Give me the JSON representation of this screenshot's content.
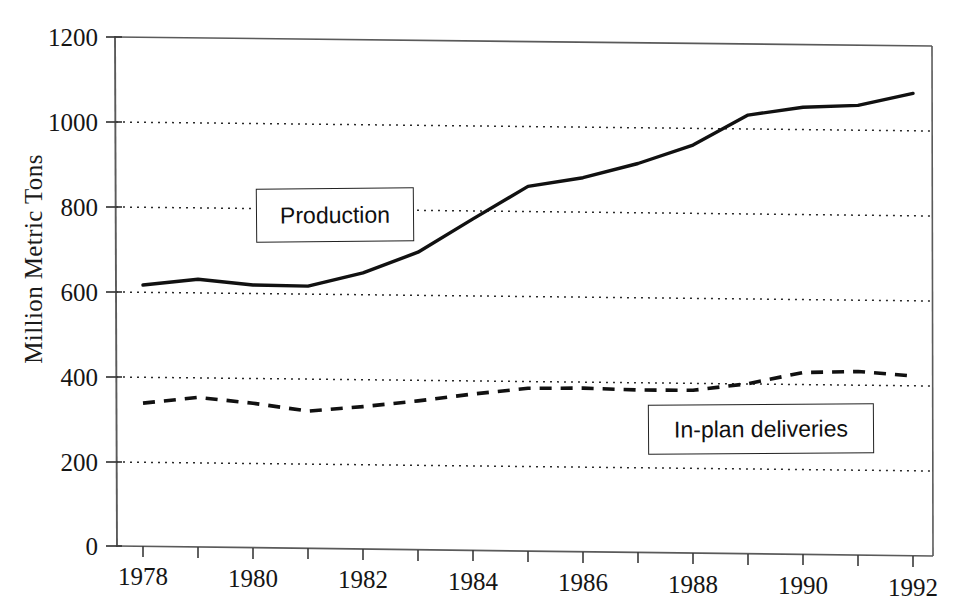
{
  "chart_data": {
    "type": "line",
    "title": "",
    "xlabel": "",
    "ylabel": "Million Metric Tons",
    "xlim": [
      1978,
      1992
    ],
    "ylim": [
      0,
      1200
    ],
    "grid": true,
    "grid_axis": "y",
    "legend_position": "inline-callout-boxes",
    "x": [
      1978,
      1979,
      1980,
      1981,
      1982,
      1983,
      1984,
      1985,
      1986,
      1987,
      1988,
      1989,
      1990,
      1991,
      1992
    ],
    "y_ticks": [
      0,
      200,
      400,
      600,
      800,
      1000,
      1200
    ],
    "y_tick_labels": [
      "0",
      "200",
      "400",
      "600",
      "800",
      "1000",
      "1200"
    ],
    "x_ticks": [
      1978,
      1979,
      1980,
      1981,
      1982,
      1983,
      1984,
      1985,
      1986,
      1987,
      1988,
      1989,
      1990,
      1991,
      1992
    ],
    "x_tick_labels": [
      "1978",
      "",
      "1980",
      "",
      "1982",
      "",
      "1984",
      "",
      "1986",
      "",
      "1988",
      "",
      "1990",
      "",
      "1992"
    ],
    "series": [
      {
        "name": "Production",
        "style": "solid",
        "color": "#111111",
        "values": [
          615,
          630,
          618,
          617,
          650,
          700,
          780,
          858,
          880,
          915,
          960,
          1032,
          1052,
          1058,
          1088
        ]
      },
      {
        "name": "In-plan deliveries",
        "style": "dashed",
        "color": "#111111",
        "values": [
          337,
          352,
          340,
          323,
          335,
          350,
          368,
          383,
          385,
          382,
          383,
          400,
          428,
          432,
          423
        ]
      }
    ]
  },
  "axes": {
    "y_title": "Million Metric Tons",
    "y_labels": [
      "1200",
      "1000",
      "800",
      "600",
      "400",
      "200",
      "0"
    ],
    "x_labels": [
      "1978",
      "1980",
      "1982",
      "1984",
      "1986",
      "1988",
      "1990",
      "1992"
    ]
  },
  "callouts": {
    "production_label": "Production",
    "deliveries_label": "In-plan deliveries"
  },
  "colors": {
    "line": "#111111",
    "frame": "#4a4a4a",
    "gridline": "#2a2a2a",
    "text": "#151515",
    "background": "#ffffff"
  }
}
